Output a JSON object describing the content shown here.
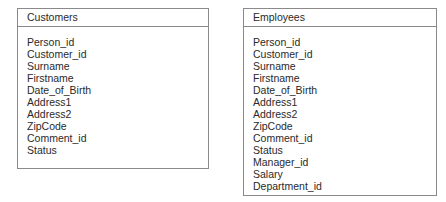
{
  "entities": [
    {
      "title": "Customers",
      "fields": [
        "Person_id",
        "Customer_id",
        "Surname",
        "Firstname",
        "Date_of_Birth",
        "Address1",
        "Address2",
        "ZipCode",
        "Comment_id",
        "Status"
      ]
    },
    {
      "title": "Employees",
      "fields": [
        "Person_id",
        "Customer_id",
        "Surname",
        "Firstname",
        "Date_of_Birth",
        "Address1",
        "Address2",
        "ZipCode",
        "Comment_id",
        "Status",
        "Manager_id",
        "Salary",
        "Department_id"
      ]
    }
  ],
  "colors": {
    "border": "#8a8a8a",
    "text": "#2a2a2a",
    "background": "#ffffff"
  }
}
